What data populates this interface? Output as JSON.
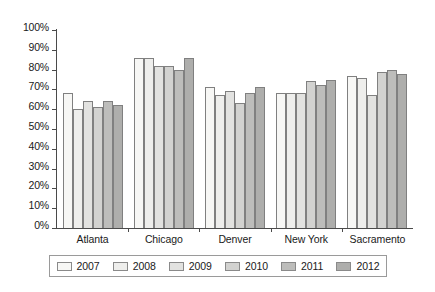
{
  "chart_data": {
    "type": "bar",
    "title": "",
    "subtitle": "",
    "xlabel": "",
    "ylabel": "",
    "ylim": [
      0,
      100
    ],
    "ytick_labels": [
      "100%",
      "90%",
      "80%",
      "70%",
      "60%",
      "50%",
      "40%",
      "30%",
      "20%",
      "10%",
      "0%"
    ],
    "ytick_values": [
      100,
      90,
      80,
      70,
      60,
      50,
      40,
      30,
      20,
      10,
      0
    ],
    "grid": false,
    "legend_position": "bottom",
    "categories": [
      "Atlanta",
      "Chicago",
      "Denver",
      "New York",
      "Sacramento"
    ],
    "series": [
      {
        "name": "2007",
        "color": "#f7f7f5",
        "values": [
          68,
          86,
          71,
          68,
          77
        ]
      },
      {
        "name": "2008",
        "color": "#eeeeec",
        "values": [
          60,
          86,
          67,
          68,
          76
        ]
      },
      {
        "name": "2009",
        "color": "#e2e2e0",
        "values": [
          64,
          82,
          69,
          68,
          67
        ]
      },
      {
        "name": "2010",
        "color": "#d2d2d0",
        "values": [
          61,
          82,
          63,
          74,
          79
        ]
      },
      {
        "name": "2011",
        "color": "#bdbdbb",
        "values": [
          64,
          80,
          68,
          72,
          80
        ]
      },
      {
        "name": "2012",
        "color": "#aeaeac",
        "values": [
          62,
          86,
          71,
          75,
          78
        ]
      }
    ]
  }
}
